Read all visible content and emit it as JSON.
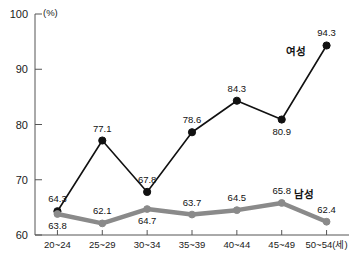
{
  "chart_data": {
    "type": "line",
    "title": "",
    "subtitle": "",
    "xlabel": "",
    "ylabel": "",
    "unit_label": "(%)",
    "categories": [
      "20~24",
      "25~29",
      "30~34",
      "35~39",
      "40~44",
      "45~49",
      "50~54(세)"
    ],
    "ylim": [
      60,
      100
    ],
    "yticks": [
      60,
      70,
      80,
      90,
      100
    ],
    "ytick_labels": [
      "60",
      "70",
      "80",
      "90",
      "100"
    ],
    "grid": false,
    "legend_position": "inline-end-of-line",
    "series": [
      {
        "name": "여성",
        "color": "#111111",
        "marker": "filled-circle",
        "values": [
          64.3,
          77.1,
          67.8,
          78.6,
          84.3,
          80.9,
          94.3
        ],
        "value_labels": [
          "64.3",
          "77.1",
          "67.8",
          "78.6",
          "84.3",
          "80.9",
          "94.3"
        ],
        "label_positions": [
          "above",
          "above",
          "above",
          "above",
          "above",
          "below",
          "above"
        ]
      },
      {
        "name": "남성",
        "color": "#8a8a8a",
        "marker": "filled-circle",
        "values": [
          63.8,
          62.1,
          64.7,
          63.7,
          64.5,
          65.8,
          62.4
        ],
        "value_labels": [
          "63.8",
          "62.1",
          "64.7",
          "63.7",
          "64.5",
          "65.8",
          "62.4"
        ],
        "label_positions": [
          "below",
          "above",
          "below",
          "above",
          "above",
          "above",
          "above"
        ]
      }
    ],
    "annotations": [
      {
        "text": "여성",
        "series": "여성"
      },
      {
        "text": "남성",
        "series": "남성"
      }
    ]
  }
}
